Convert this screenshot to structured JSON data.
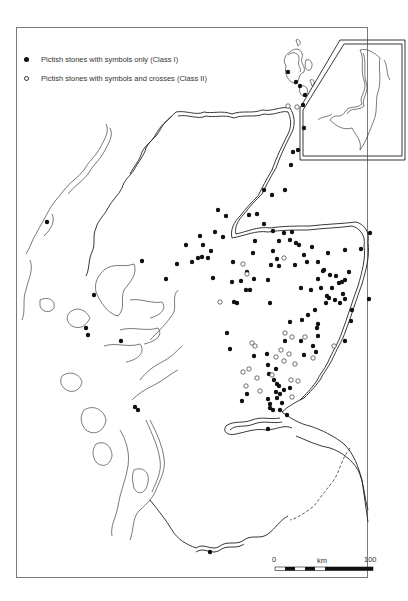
{
  "legend": {
    "items": [
      {
        "symbol": "filled-circle",
        "label": "Pictish stones with symbols only (Class I)"
      },
      {
        "symbol": "open-circle",
        "label": "Pictish stones with symbols and crosses (Class II)"
      }
    ]
  },
  "scale_bar": {
    "start_label": "0",
    "unit_label": "km",
    "end_label": "100"
  },
  "inset": {
    "subject": "Shetland Islands"
  },
  "colors": {
    "line": "#222222",
    "frame": "#7a7a7a",
    "background": "#ffffff"
  },
  "sites": {
    "class_I": [
      [
        288,
        72
      ],
      [
        296,
        82
      ],
      [
        300,
        86
      ],
      [
        305,
        95
      ],
      [
        303,
        105
      ],
      [
        304,
        128
      ],
      [
        298,
        150
      ],
      [
        293,
        152
      ],
      [
        291,
        165
      ],
      [
        285,
        190
      ],
      [
        272,
        195
      ],
      [
        264,
        190
      ],
      [
        257,
        214
      ],
      [
        249,
        215
      ],
      [
        215,
        232
      ],
      [
        218,
        210
      ],
      [
        226,
        216
      ],
      [
        223,
        237
      ],
      [
        264,
        224
      ],
      [
        273,
        231
      ],
      [
        279,
        241
      ],
      [
        284,
        233
      ],
      [
        273,
        251
      ],
      [
        277,
        259
      ],
      [
        279,
        266
      ],
      [
        295,
        265
      ],
      [
        255,
        241
      ],
      [
        247,
        272
      ],
      [
        200,
        236
      ],
      [
        186,
        245
      ],
      [
        203,
        245
      ],
      [
        211,
        251
      ],
      [
        202,
        257
      ],
      [
        208,
        258
      ],
      [
        192,
        262
      ],
      [
        233,
        262
      ],
      [
        253,
        253
      ],
      [
        271,
        265
      ],
      [
        241,
        281
      ],
      [
        254,
        279
      ],
      [
        268,
        280
      ],
      [
        250,
        290
      ],
      [
        213,
        278
      ],
      [
        234,
        302
      ],
      [
        237,
        303
      ],
      [
        246,
        290
      ],
      [
        270,
        303
      ],
      [
        304,
        255
      ],
      [
        307,
        262
      ],
      [
        318,
        262
      ],
      [
        324,
        270
      ],
      [
        345,
        250
      ],
      [
        343,
        294
      ],
      [
        311,
        290
      ],
      [
        312,
        247
      ],
      [
        339,
        283
      ],
      [
        345,
        280
      ],
      [
        336,
        276
      ],
      [
        323,
        271
      ],
      [
        330,
        275
      ],
      [
        329,
        298
      ],
      [
        342,
        282
      ],
      [
        332,
        288
      ],
      [
        327,
        296
      ],
      [
        345,
        299
      ],
      [
        349,
        272
      ],
      [
        326,
        303
      ],
      [
        315,
        310
      ],
      [
        308,
        315
      ],
      [
        302,
        320
      ],
      [
        317,
        328
      ],
      [
        290,
        322
      ],
      [
        318,
        336
      ],
      [
        301,
        288
      ],
      [
        328,
        253
      ],
      [
        318,
        279
      ],
      [
        321,
        288
      ],
      [
        335,
        300
      ],
      [
        340,
        303
      ],
      [
        352,
        310
      ],
      [
        361,
        249
      ],
      [
        370,
        233
      ],
      [
        369,
        299
      ],
      [
        227,
        333
      ],
      [
        230,
        349
      ],
      [
        254,
        356
      ],
      [
        267,
        354
      ],
      [
        268,
        365
      ],
      [
        276,
        369
      ],
      [
        269,
        374
      ],
      [
        277,
        384
      ],
      [
        274,
        380
      ],
      [
        279,
        386
      ],
      [
        276,
        392
      ],
      [
        268,
        399
      ],
      [
        284,
        390
      ],
      [
        247,
        394
      ],
      [
        242,
        401
      ],
      [
        285,
        341
      ],
      [
        301,
        341
      ],
      [
        313,
        346
      ],
      [
        304,
        355
      ],
      [
        316,
        352
      ],
      [
        318,
        324
      ],
      [
        345,
        341
      ],
      [
        351,
        321
      ],
      [
        270,
        404
      ],
      [
        270,
        408
      ],
      [
        273,
        410
      ],
      [
        280,
        410
      ],
      [
        287,
        415
      ],
      [
        290,
        388
      ],
      [
        280,
        394
      ],
      [
        277,
        398
      ],
      [
        282,
        403
      ],
      [
        268,
        429
      ],
      [
        210,
        552
      ],
      [
        135,
        407
      ],
      [
        138,
        410
      ],
      [
        47,
        222
      ],
      [
        94,
        295
      ],
      [
        86,
        328
      ],
      [
        88,
        335
      ],
      [
        121,
        341
      ],
      [
        198,
        258
      ],
      [
        177,
        264
      ],
      [
        142,
        261
      ],
      [
        166,
        279
      ],
      [
        232,
        282
      ],
      [
        292,
        232
      ],
      [
        290,
        240
      ],
      [
        296,
        243
      ],
      [
        299,
        245
      ]
    ],
    "class_II": [
      [
        297,
        107
      ],
      [
        288,
        106
      ],
      [
        284,
        258
      ],
      [
        243,
        264
      ],
      [
        247,
        274
      ],
      [
        220,
        302
      ],
      [
        285,
        333
      ],
      [
        292,
        337
      ],
      [
        305,
        337
      ],
      [
        334,
        346
      ],
      [
        243,
        372
      ],
      [
        249,
        369
      ],
      [
        252,
        343
      ],
      [
        255,
        346
      ],
      [
        276,
        357
      ],
      [
        284,
        361
      ],
      [
        289,
        354
      ],
      [
        281,
        350
      ],
      [
        295,
        364
      ],
      [
        313,
        358
      ],
      [
        291,
        380
      ],
      [
        272,
        375
      ],
      [
        257,
        378
      ],
      [
        260,
        391
      ],
      [
        292,
        397
      ],
      [
        246,
        386
      ],
      [
        298,
        381
      ]
    ]
  }
}
